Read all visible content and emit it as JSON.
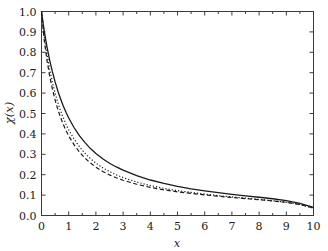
{
  "chart_data": {
    "type": "line",
    "title": "",
    "xlabel": "x",
    "ylabel": "χ(x)",
    "xlim": [
      0,
      10
    ],
    "ylim": [
      0.0,
      1.0
    ],
    "grid": false,
    "legend": "none",
    "frame": "box-all-sides-inward-ticks",
    "xticks": [
      0,
      1,
      2,
      3,
      4,
      5,
      6,
      7,
      8,
      9,
      10
    ],
    "xtick_labels": [
      "0",
      "1",
      "2",
      "3",
      "4",
      "5",
      "6",
      "7",
      "8",
      "9",
      "10"
    ],
    "yticks": [
      0.0,
      0.1,
      0.2,
      0.3,
      0.4,
      0.5,
      0.6,
      0.7,
      0.8,
      0.9,
      1.0
    ],
    "ytick_labels": [
      "0.0",
      "0.1",
      "0.2",
      "0.3",
      "0.4",
      "0.5",
      "0.6",
      "0.7",
      "0.8",
      "0.9",
      "1.0"
    ],
    "x": [
      0.0,
      0.1,
      0.2,
      0.3,
      0.4,
      0.5,
      0.6,
      0.7,
      0.8,
      0.9,
      1.0,
      1.2,
      1.4,
      1.6,
      1.8,
      2.0,
      2.25,
      2.5,
      2.75,
      3.0,
      3.5,
      4.0,
      4.5,
      5.0,
      5.5,
      6.0,
      6.5,
      7.0,
      7.5,
      8.0,
      8.5,
      9.0,
      9.5,
      10.0
    ],
    "series": [
      {
        "name": "solid",
        "style": "solid",
        "values": [
          1.0,
          0.905,
          0.828,
          0.762,
          0.705,
          0.655,
          0.611,
          0.572,
          0.537,
          0.506,
          0.478,
          0.43,
          0.39,
          0.357,
          0.328,
          0.304,
          0.278,
          0.256,
          0.238,
          0.222,
          0.195,
          0.174,
          0.157,
          0.143,
          0.131,
          0.121,
          0.112,
          0.104,
          0.0965,
          0.0895,
          0.082,
          0.073,
          0.06,
          0.0395
        ]
      },
      {
        "name": "dotted",
        "style": "dotted",
        "values": [
          1.0,
          0.88,
          0.79,
          0.716,
          0.654,
          0.6,
          0.554,
          0.514,
          0.479,
          0.448,
          0.42,
          0.374,
          0.336,
          0.305,
          0.279,
          0.257,
          0.234,
          0.215,
          0.199,
          0.186,
          0.164,
          0.147,
          0.133,
          0.122,
          0.113,
          0.105,
          0.0975,
          0.091,
          0.085,
          0.079,
          0.0725,
          0.065,
          0.054,
          0.036
        ]
      },
      {
        "name": "dashed",
        "style": "dashed",
        "values": [
          1.0,
          0.86,
          0.762,
          0.684,
          0.62,
          0.566,
          0.52,
          0.481,
          0.447,
          0.417,
          0.39,
          0.346,
          0.31,
          0.281,
          0.257,
          0.237,
          0.216,
          0.199,
          0.185,
          0.173,
          0.153,
          0.138,
          0.126,
          0.116,
          0.108,
          0.101,
          0.0945,
          0.0885,
          0.083,
          0.0775,
          0.0715,
          0.0645,
          0.054,
          0.037
        ]
      }
    ]
  }
}
